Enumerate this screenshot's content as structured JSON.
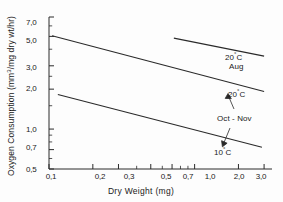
{
  "chart_data": {
    "type": "line",
    "title": "",
    "xlabel": "Dry Weight (mg)",
    "ylabel": "Oxygen Consumption (mm3/mg dry wt/hr)",
    "xscale": "log",
    "yscale": "log",
    "xlim": [
      0.1,
      3.4
    ],
    "ylim": [
      0.5,
      7.0
    ],
    "grid": false,
    "legend": "none (inline annotations)",
    "xticks": [
      "0,1",
      "0,2",
      "0,3",
      "0,5",
      "0,7",
      "1,0",
      "2,0",
      "3,0"
    ],
    "xtick_values": [
      0.1,
      0.2,
      0.3,
      0.5,
      0.7,
      1.0,
      2.0,
      3.0
    ],
    "xminor_values": [
      0.4,
      0.6,
      0.8,
      0.9
    ],
    "yticks": [
      "7,0",
      "5,0",
      "3,0",
      "2,0",
      "1,0",
      "0,7",
      "0,5"
    ],
    "ytick_values": [
      7.0,
      5.0,
      3.0,
      2.0,
      1.0,
      0.7,
      0.5
    ],
    "yminor_values": [
      6.0,
      4.0,
      2.5,
      1.5,
      0.9,
      0.8,
      0.6
    ],
    "series": [
      {
        "name": "20 C Aug",
        "x": [
          0.72,
          3.0
        ],
        "y": [
          4.85,
          3.55
        ]
      },
      {
        "name": "20 C Oct - Nov",
        "x": [
          0.105,
          3.0
        ],
        "y": [
          5.05,
          1.92
        ]
      },
      {
        "name": "10 C Oct - Nov",
        "x": [
          0.115,
          2.9
        ],
        "y": [
          1.82,
          0.73
        ]
      }
    ],
    "annotations": [
      {
        "id": "aug-label",
        "text": "20",
        "unit": "C",
        "deg": "°",
        "x": 3.05,
        "y": 3.45
      },
      {
        "id": "aug-season",
        "text": "Aug",
        "x": 3.05,
        "y": 2.82
      },
      {
        "id": "temp-20",
        "text": "20",
        "unit": "C",
        "deg": "°",
        "x": 3.05,
        "y": 1.9
      },
      {
        "id": "season-oct",
        "text": "Oct - Nov",
        "x": 2.95,
        "y": 1.13
      },
      {
        "id": "temp-10",
        "text": "10",
        "unit": "C",
        "deg": "°",
        "x": 2.85,
        "y": 0.73
      }
    ]
  },
  "colors": {
    "line": "#2a2a2a",
    "axis": "#2a2a2a",
    "text": "#1a1a1a",
    "background": "#fdfdfd"
  },
  "labels": {
    "x_title": "Dry  Weight  (mg)",
    "y_title_main": "Oxygen Consumption  (mm",
    "y_title_sup": "3",
    "y_title_rest": "/mg dry wt/hr)",
    "y_title_full": "Oxygen Consumption (mm3/mg dry wt/hr)",
    "aug_temp": "20",
    "aug_deg": "°",
    "aug_c": "C",
    "aug_month": "Aug",
    "oct_temp_hi": "20",
    "oct_deg_hi": "°",
    "oct_c_hi": "C",
    "oct_season": "Oct - Nov",
    "oct_temp_lo": "10",
    "oct_deg_lo": "°",
    "oct_c_lo": "C",
    "xt0": "0,1",
    "xt1": "0,2",
    "xt2": "0,3",
    "xt3": "0,5",
    "xt4": "0,7",
    "xt5": "1,0",
    "xt6": "2,0",
    "xt7": "3,0",
    "yt0": "7,0",
    "yt1": "5,0",
    "yt2": "3,0",
    "yt3": "2,0",
    "yt4": "1,0",
    "yt5": "0,7",
    "yt6": "0,5"
  }
}
